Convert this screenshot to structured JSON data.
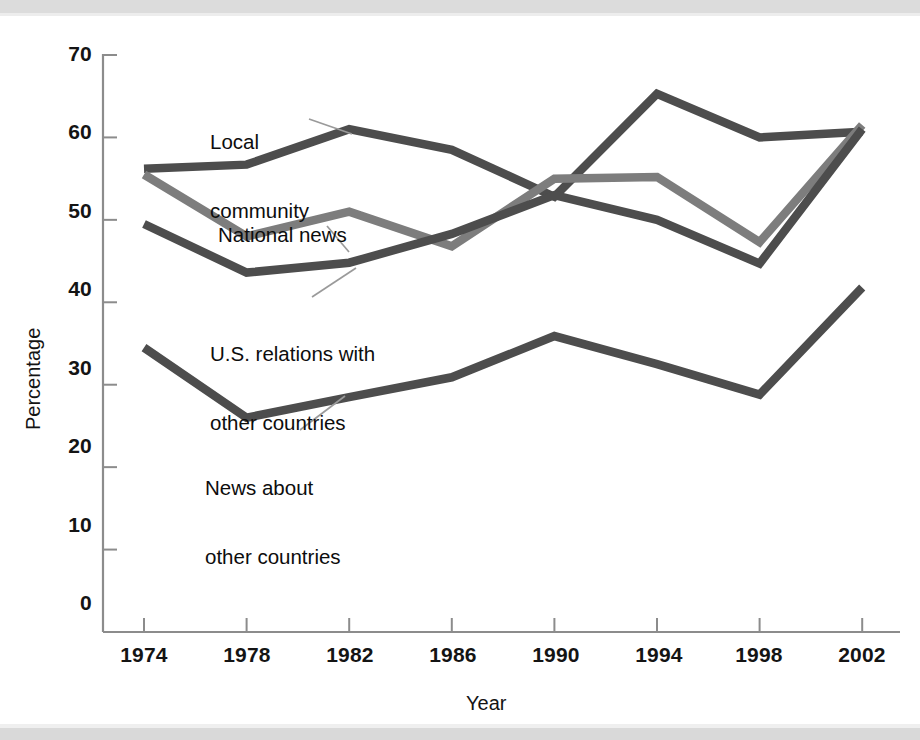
{
  "figure": {
    "background_color": "#ffffff",
    "scan_band_color": "#dcdcdc"
  },
  "chart_data": {
    "type": "line",
    "title": "",
    "xlabel": "Year",
    "ylabel": "Percentage",
    "x": [
      1974,
      1978,
      1982,
      1986,
      1990,
      1994,
      1998,
      2002
    ],
    "categories": [
      "1974",
      "1978",
      "1982",
      "1986",
      "1990",
      "1994",
      "1998",
      "2002"
    ],
    "xlim": [
      1972,
      2004
    ],
    "ylim": [
      0,
      70
    ],
    "yticks": [
      0,
      10,
      20,
      30,
      40,
      50,
      60,
      70
    ],
    "ytick_labels": [
      "0",
      "10",
      "20",
      "30",
      "40",
      "50",
      "60",
      "70"
    ],
    "grid": false,
    "legend": "inline-annotations",
    "series": [
      {
        "name": "Local community",
        "color": "#4d4d4d",
        "values": [
          56.2,
          56.7,
          61.0,
          58.5,
          52.8,
          65.3,
          60.0,
          60.7
        ]
      },
      {
        "name": "National news",
        "color": "#7d7d7d",
        "values": [
          55.5,
          48.0,
          51.0,
          46.8,
          55.0,
          55.2,
          47.3,
          61.5
        ]
      },
      {
        "name": "U.S. relations with other countries",
        "color": "#4d4d4d",
        "values": [
          49.5,
          43.6,
          44.8,
          48.3,
          53.0,
          50.0,
          44.7,
          61.0
        ]
      },
      {
        "name": "News about other countries",
        "color": "#4d4d4d",
        "values": [
          34.5,
          26.0,
          28.5,
          30.9,
          35.9,
          32.5,
          28.8,
          41.8
        ]
      }
    ],
    "annotations": [
      {
        "id": "local-community",
        "text_line1": "Local",
        "text_line2": "community"
      },
      {
        "id": "national-news",
        "text_line1": "National news",
        "text_line2": ""
      },
      {
        "id": "us-relations",
        "text_line1": "U.S. relations with",
        "text_line2": "other countries"
      },
      {
        "id": "news-other-countries",
        "text_line1": "News about",
        "text_line2": "other countries"
      }
    ]
  }
}
